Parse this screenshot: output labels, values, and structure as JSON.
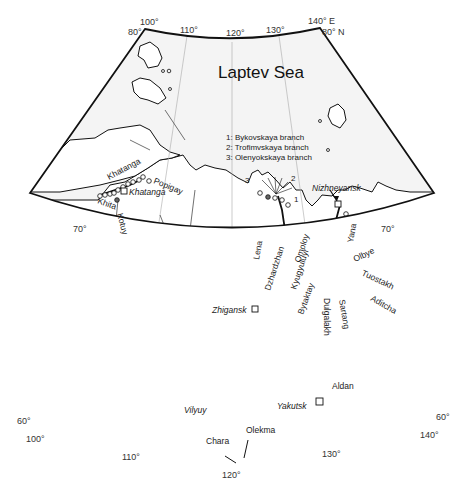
{
  "map": {
    "sea_label": "Laptev Sea",
    "legend": [
      "1: Bykovskaya branch",
      "2: Trofimvskaya branch",
      "3: Olenyokskaya branch"
    ],
    "branch_markers": [
      "1",
      "2",
      "3"
    ],
    "longitude_ticks_top": [
      "100°",
      "110°",
      "120°",
      "130°",
      "140° E"
    ],
    "longitude_ticks_bottom": [
      "100°",
      "110°",
      "120°",
      "130°",
      "140°"
    ],
    "latitude_ticks_left": [
      "80°",
      "70°",
      "60°"
    ],
    "latitude_ticks_right": [
      "80° N",
      "70°",
      "60°"
    ],
    "rivers": {
      "khatanga": "Khatanga",
      "khita": "Khita",
      "popigay": "Popigay",
      "kotuy": "Kotuy",
      "lena": "Lena",
      "dzhardzhan": "Dzhardzhan",
      "omoloy": "Omoloy",
      "kyugyuluyr": "Kyugyuluyr",
      "bytaktay": "Bytaktay",
      "dulgalakh": "Dulgalakh",
      "sartang": "Sartang",
      "yana": "Yana",
      "olbye": "Olbye",
      "tuostakh": "Tuostakh",
      "aditcha": "Aditcha",
      "aldan": "Aldan",
      "vilyuy": "Vilyuy",
      "olekma": "Olekma",
      "chara": "Chara"
    },
    "towns": {
      "khatanga": "Khatanga",
      "nizhneyansk": "Nizhneyansk",
      "zhigansk": "Zhigansk",
      "yakutsk": "Yakutsk"
    },
    "colors": {
      "frame": "#111111",
      "sea": "#f4f4f4",
      "land": "#ffffff",
      "river": "#333333",
      "graticule": "#aaaaaa"
    }
  }
}
